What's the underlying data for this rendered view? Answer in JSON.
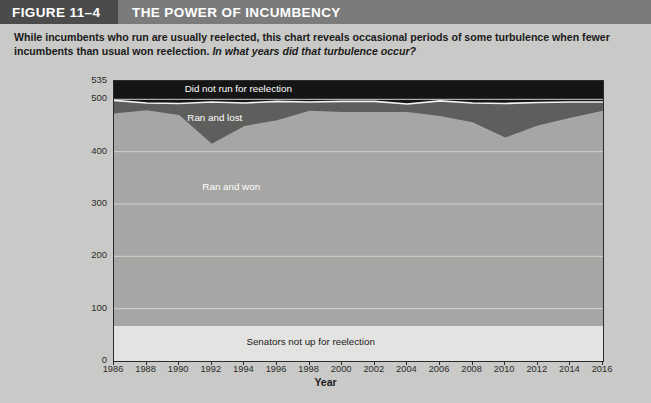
{
  "figure": {
    "tag": "FIGURE 11–4",
    "title": "THE POWER OF INCUMBENCY"
  },
  "subtitle": {
    "statement": "While incumbents who run are usually reelected, this chart reveals occasional periods of some turbulence when fewer incumbents than usual won reelection.",
    "question": "In what years did that turbulence occur?"
  },
  "colors": {
    "tag_bg": "#4b4b4b",
    "title_bg": "#7b7b7b",
    "page_bg": "#c9c9c7",
    "not_up": "#e3e3e1",
    "ran_won": "#a6a6a4",
    "ran_lost": "#5e5e5c",
    "did_not_run": "#151515",
    "gridline": "#d2d2d0",
    "axis": "#2b2b2b"
  },
  "chart_data": {
    "type": "area",
    "title": "THE POWER OF INCUMBENCY",
    "xlabel": "Year",
    "ylabel": "",
    "stacked": true,
    "grid": true,
    "legend": "inline-labels",
    "xlim": [
      1986,
      2016
    ],
    "ylim": [
      0,
      535
    ],
    "yticks": [
      0,
      100,
      200,
      300,
      400,
      500,
      535
    ],
    "xticks": [
      1986,
      1988,
      1990,
      1992,
      1994,
      1996,
      1998,
      2000,
      2002,
      2004,
      2006,
      2008,
      2010,
      2012,
      2014,
      2016
    ],
    "x": [
      1986,
      1988,
      1990,
      1992,
      1994,
      1996,
      1998,
      2000,
      2002,
      2004,
      2006,
      2008,
      2010,
      2012,
      2014,
      2016
    ],
    "series": [
      {
        "name": "Senators not up for reelection",
        "color": "#e3e3e1",
        "values": [
          67,
          67,
          67,
          67,
          67,
          67,
          67,
          67,
          67,
          67,
          67,
          67,
          67,
          67,
          67,
          67
        ]
      },
      {
        "name": "Ran and won",
        "color": "#a6a6a4",
        "values": [
          406,
          412,
          403,
          348,
          382,
          393,
          411,
          409,
          409,
          409,
          401,
          389,
          360,
          383,
          398,
          411
        ]
      },
      {
        "name": "Ran and lost",
        "color": "#5e5e5c",
        "values": [
          25,
          14,
          22,
          80,
          44,
          36,
          17,
          20,
          20,
          15,
          29,
          37,
          65,
          44,
          30,
          17
        ]
      },
      {
        "name": "Did not run for reelection",
        "color": "#151515",
        "values": [
          37,
          42,
          43,
          40,
          42,
          39,
          40,
          39,
          39,
          44,
          38,
          42,
          43,
          41,
          40,
          40
        ]
      }
    ],
    "annotations": [
      {
        "text": "Did not run for reelection",
        "x": 1993,
        "y": 517
      },
      {
        "text": "Ran and lost",
        "x": 1992,
        "y": 470
      },
      {
        "text": "Ran and won",
        "x": 1993,
        "y": 330
      },
      {
        "text": "Senators not up for reelection",
        "x": 1998,
        "y": 33
      }
    ]
  }
}
